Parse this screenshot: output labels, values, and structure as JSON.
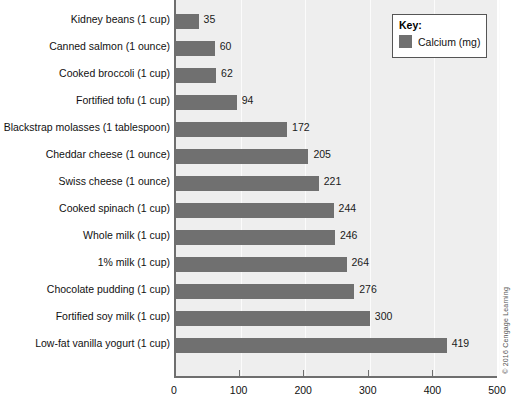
{
  "chart_data": {
    "type": "bar",
    "orientation": "horizontal",
    "title": "",
    "xlabel": "",
    "ylabel": "",
    "xlim": [
      0,
      500
    ],
    "xticks": [
      0,
      100,
      200,
      300,
      400,
      500
    ],
    "grid": true,
    "grid_axis": "x",
    "legend": {
      "title": "Key:",
      "position": "top-right",
      "entries": [
        {
          "name": "Calcium (mg)",
          "color": "#707070"
        }
      ]
    },
    "series_name": "Calcium (mg)",
    "categories": [
      "Kidney beans (1 cup)",
      "Canned salmon (1 ounce)",
      "Cooked broccoli (1 cup)",
      "Fortified tofu (1 cup)",
      "Blackstrap molasses (1 tablespoon)",
      "Cheddar cheese (1 ounce)",
      "Swiss cheese (1 ounce)",
      "Cooked spinach (1 cup)",
      "Whole milk (1 cup)",
      "1% milk (1 cup)",
      "Chocolate pudding (1 cup)",
      "Fortified soy milk (1 cup)",
      "Low-fat vanilla yogurt (1 cup)"
    ],
    "values": [
      35,
      60,
      62,
      94,
      172,
      205,
      221,
      244,
      246,
      264,
      276,
      300,
      419
    ],
    "value_labels": [
      "35",
      "60",
      "62",
      "94",
      "172",
      "205",
      "221",
      "244",
      "246",
      "264",
      "276",
      "300",
      "419"
    ]
  },
  "colors": {
    "bar": "#707070",
    "plot_background": "#eeeeee",
    "axis": "#6e6e6e",
    "gridline": "#fbfbfb",
    "text": "#111111"
  },
  "credit": "© 2016 Cengage Learning"
}
